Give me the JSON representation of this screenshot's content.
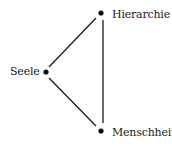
{
  "diagram": {
    "type": "triangle-relation",
    "nodes": [
      {
        "id": "hierarchie",
        "label": "Hierarchie",
        "x": 101,
        "y": 13,
        "label_x": 112,
        "label_y": 9
      },
      {
        "id": "seele",
        "label": "Seele",
        "x": 46,
        "y": 72,
        "label_x": 10,
        "label_y": 66
      },
      {
        "id": "menschheit",
        "label": "Menschheit",
        "x": 101,
        "y": 131,
        "label_x": 112,
        "label_y": 127
      }
    ],
    "edges": [
      {
        "from": "seele",
        "to": "hierarchie",
        "x1": 49,
        "y1": 67,
        "x2": 96,
        "y2": 18
      },
      {
        "from": "seele",
        "to": "menschheit",
        "x1": 49,
        "y1": 78,
        "x2": 96,
        "y2": 126
      },
      {
        "from": "hierarchie",
        "to": "menschheit",
        "x1": 103,
        "y1": 20,
        "x2": 103,
        "y2": 123
      }
    ],
    "colors": {
      "line": "#1a1a1a",
      "dot": "#111111",
      "background": "#ffffff"
    }
  }
}
